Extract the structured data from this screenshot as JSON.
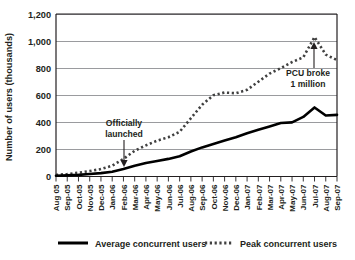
{
  "chart_data": {
    "type": "line",
    "title": "",
    "xlabel": "",
    "ylabel": "Number of users (thousands)",
    "ylim": [
      0,
      1200
    ],
    "yticks": [
      0,
      200,
      400,
      600,
      800,
      1000,
      1200
    ],
    "ytick_labels": [
      "0",
      "200",
      "400",
      "600",
      "800",
      "1,000",
      "1,200"
    ],
    "grid": true,
    "legend_position": "bottom",
    "categories": [
      "Aug 05",
      "Sep-05",
      "Oct-05",
      "Nov-05",
      "Dec-05",
      "Jan-06",
      "Feb-06",
      "Mar-06",
      "Apr-06",
      "May-06",
      "Jun-06",
      "Jul-06",
      "Aug-06",
      "Sep-06",
      "Oct-06",
      "Nov-06",
      "Dec-06",
      "Jan-07",
      "Feb-07",
      "Mar-07",
      "Apr-07",
      "May-07",
      "Jun-07",
      "Jul-07",
      "Aug-07",
      "Sep-07"
    ],
    "series": [
      {
        "name": "Average concurrent users",
        "style": "solid",
        "color": "#000000",
        "values": [
          5,
          8,
          12,
          18,
          25,
          35,
          55,
          80,
          100,
          115,
          130,
          150,
          185,
          215,
          240,
          265,
          290,
          320,
          345,
          370,
          395,
          400,
          440,
          510,
          450,
          455
        ]
      },
      {
        "name": "Peak concurrent users",
        "style": "dashed",
        "color": "#404040",
        "values": [
          12,
          18,
          28,
          40,
          55,
          80,
          130,
          190,
          230,
          265,
          290,
          330,
          430,
          530,
          600,
          620,
          615,
          640,
          700,
          760,
          800,
          845,
          880,
          1030,
          900,
          860
        ]
      }
    ],
    "annotations": [
      {
        "id": "officially-launched",
        "lines": [
          "Officially",
          "launched"
        ],
        "points_to_category": "Feb-06"
      },
      {
        "id": "pcu-broke-1-million",
        "lines": [
          "PCU broke",
          "1 million"
        ],
        "points_to_category": "Jul-07"
      }
    ]
  },
  "legend": {
    "items": [
      {
        "label": "Average concurrent users",
        "style": "solid"
      },
      {
        "label": "Peak concurrent users",
        "style": "dashed"
      }
    ]
  }
}
